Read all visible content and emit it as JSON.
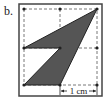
{
  "figure": {
    "label": "b.",
    "scale_label": "1 cm",
    "colors": {
      "fill": "#555555",
      "stroke": "#222222",
      "grid": "#555555",
      "frame": "#444444"
    },
    "grid": {
      "columns": 2,
      "rows": 2,
      "points": [
        [
          24,
          9
        ],
        [
          60,
          9
        ],
        [
          97,
          9
        ],
        [
          24,
          48
        ],
        [
          60,
          48
        ],
        [
          97,
          48
        ],
        [
          24,
          85
        ],
        [
          60,
          85
        ],
        [
          97,
          85
        ]
      ]
    },
    "shape_vertices": [
      [
        24,
        48
      ],
      [
        97,
        9
      ],
      [
        60,
        85
      ],
      [
        24,
        85
      ],
      [
        60,
        48
      ]
    ]
  }
}
